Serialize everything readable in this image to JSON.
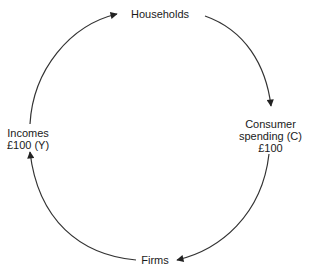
{
  "diagram": {
    "type": "circular-flow",
    "nodes": {
      "households": {
        "label": "Households"
      },
      "consumer_spending": {
        "lines": [
          "Consumer",
          "spending (C)",
          "£100"
        ]
      },
      "firms": {
        "label": "Firms"
      },
      "incomes": {
        "lines": [
          "Incomes",
          "£100 (Y)"
        ]
      }
    },
    "flows": [
      {
        "from": "Households",
        "to": "Firms",
        "via": "Consumer spending (C) £100",
        "direction": "clockwise"
      },
      {
        "from": "Firms",
        "to": "Households",
        "via": "Incomes £100 (Y)",
        "direction": "clockwise"
      }
    ],
    "colors": {
      "line": "#333333",
      "text": "#1a1a1a",
      "background": "#ffffff"
    }
  }
}
